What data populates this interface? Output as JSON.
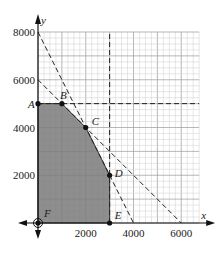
{
  "chart_data": {
    "type": "line",
    "title": "",
    "xlabel": "x",
    "ylabel": "y",
    "xlim": [
      0,
      6750
    ],
    "ylim": [
      0,
      8000
    ],
    "grid": true,
    "grid_minor_step": 250,
    "grid_major_step": 1000,
    "x_ticks": [
      {
        "value": 2000,
        "label": "2000"
      },
      {
        "value": 4000,
        "label": "4000"
      },
      {
        "value": 6000,
        "label": "6000"
      }
    ],
    "y_ticks": [
      {
        "value": 2000,
        "label": "2000"
      },
      {
        "value": 4000,
        "label": "4000"
      },
      {
        "value": 6000,
        "label": "6000"
      },
      {
        "value": 8000,
        "label": "8000"
      }
    ],
    "constraint_lines": [
      {
        "name": "y = 5000",
        "points": [
          [
            0,
            5000
          ],
          [
            6750,
            5000
          ]
        ],
        "style": "dashed"
      },
      {
        "name": "x = 3000",
        "points": [
          [
            3000,
            0
          ],
          [
            3000,
            8000
          ]
        ],
        "style": "dashed"
      },
      {
        "name": "2x + y = 8000",
        "points": [
          [
            0,
            8000
          ],
          [
            4000,
            0
          ]
        ],
        "style": "dashed"
      },
      {
        "name": "x + y = 6000",
        "points": [
          [
            0,
            6000
          ],
          [
            6000,
            0
          ]
        ],
        "style": "dashed"
      }
    ],
    "feasible_region": {
      "vertices": [
        [
          0,
          0
        ],
        [
          0,
          5000
        ],
        [
          1000,
          5000
        ],
        [
          2000,
          4000
        ],
        [
          3000,
          2000
        ],
        [
          3000,
          0
        ]
      ],
      "fill": "#7a7a7a"
    },
    "points": [
      {
        "label": "A",
        "x": 0,
        "y": 5000
      },
      {
        "label": "B",
        "x": 1000,
        "y": 5000
      },
      {
        "label": "C",
        "x": 2000,
        "y": 4000
      },
      {
        "label": "D",
        "x": 3000,
        "y": 2000
      },
      {
        "label": "E",
        "x": 3000,
        "y": 0
      },
      {
        "label": "F",
        "x": 0,
        "y": 0
      }
    ]
  }
}
